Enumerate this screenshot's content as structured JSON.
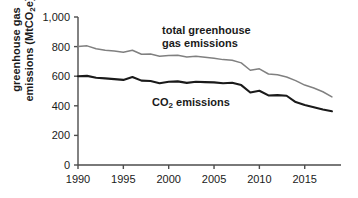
{
  "chart_data": {
    "type": "line",
    "title": "",
    "xlabel": "",
    "ylabel": "greenhouse gas emissions (MtCO2e)",
    "ylabel_line1": "greenhouse gas",
    "ylabel_line2": "emissions (MtCO",
    "ylabel_sub": "2",
    "ylabel_line2_end": "e)",
    "xlim": [
      1990,
      2019
    ],
    "ylim": [
      0,
      1000
    ],
    "grid": false,
    "legend": "inline-annotations",
    "yticks": [
      "0",
      "200",
      "400",
      "600",
      "800",
      "1,000"
    ],
    "ytick_values": [
      0,
      200,
      400,
      600,
      800,
      1000
    ],
    "xticks": [
      "1990",
      "1995",
      "2000",
      "2005",
      "2010",
      "2015"
    ],
    "xtick_values": [
      1990,
      1995,
      2000,
      2005,
      2010,
      2015
    ],
    "x": [
      1990,
      1991,
      1992,
      1993,
      1994,
      1995,
      1996,
      1997,
      1998,
      1999,
      2000,
      2001,
      2002,
      2003,
      2004,
      2005,
      2006,
      2007,
      2008,
      2009,
      2010,
      2011,
      2012,
      2013,
      2014,
      2015,
      2016,
      2017,
      2018
    ],
    "series": [
      {
        "name": "total greenhouse gas emissions",
        "color": "#808080",
        "annotation_line1": "total greenhouse",
        "annotation_line2": "gas emissions",
        "values": [
          800,
          805,
          785,
          775,
          770,
          762,
          775,
          748,
          750,
          735,
          740,
          742,
          730,
          735,
          728,
          722,
          712,
          708,
          690,
          640,
          650,
          615,
          610,
          595,
          570,
          540,
          520,
          495,
          460
        ]
      },
      {
        "name": "CO2 emissions",
        "color": "#1a1a1a",
        "annotation_line1": "CO",
        "annotation_sub": "2",
        "annotation_line2": " emissions",
        "values": [
          600,
          602,
          590,
          585,
          580,
          575,
          595,
          570,
          568,
          552,
          562,
          565,
          555,
          562,
          560,
          558,
          552,
          556,
          540,
          490,
          502,
          470,
          472,
          468,
          425,
          405,
          390,
          375,
          363
        ]
      }
    ]
  },
  "axes_pixels": {
    "left": 78,
    "right": 341,
    "top": 17,
    "bottom": 165
  }
}
